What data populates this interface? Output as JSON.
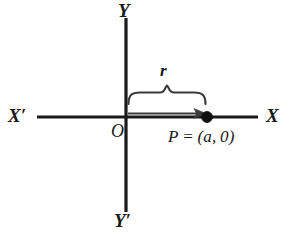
{
  "figure": {
    "type": "diagram",
    "background_color": "#ffffff",
    "ink_color": "#1a1a1a"
  },
  "axes": {
    "horizontal": {
      "name": "x-axis",
      "negative_label": "X′",
      "positive_label": "X",
      "y_position": 117,
      "x_start": 37,
      "x_end": 258
    },
    "vertical": {
      "name": "y-axis",
      "positive_label": "Y",
      "negative_label": "Y′",
      "x_position": 126,
      "y_start": 18,
      "y_end": 212
    },
    "origin": {
      "label": "O",
      "x": 126,
      "y": 117
    }
  },
  "point": {
    "name": "P",
    "label": "P = (a, 0)",
    "coordinates": "(a, 0)",
    "x": 207,
    "y": 117,
    "marker": "filled-circle",
    "marker_radius": 5
  },
  "measure": {
    "label": "r",
    "description": "distance from origin O to point P",
    "brace_from_x": 128,
    "brace_to_x": 206,
    "brace_y": 92,
    "arrow_from_x": 128,
    "arrow_to_x": 200,
    "arrow_y": 113
  },
  "icons": {
    "point_marker": "filled-dot-icon",
    "arrow": "right-arrow-icon",
    "brace": "curly-brace-icon"
  }
}
